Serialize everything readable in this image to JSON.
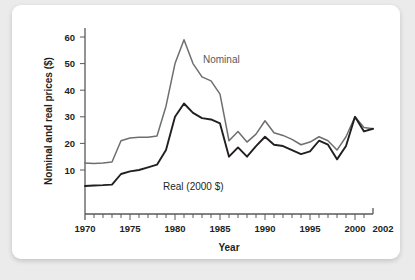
{
  "card": {
    "background_color": "#ffffff",
    "page_background_color": "#ebebeb"
  },
  "chart_data": {
    "type": "line",
    "title": "",
    "subtitle": "",
    "xlabel": "Year",
    "ylabel": "Nominal and real prices ($)",
    "xlim": [
      1970,
      2002
    ],
    "ylim": [
      0,
      65
    ],
    "xticks": [
      1970,
      1975,
      1980,
      1985,
      1990,
      1995,
      2000,
      2002
    ],
    "xticklabels": [
      "1970",
      "1975",
      "1980",
      "1985",
      "1990",
      "1995",
      "2000",
      "2002"
    ],
    "yticks": [
      10,
      20,
      30,
      40,
      50,
      60
    ],
    "yticklabels": [
      "10",
      "20",
      "30",
      "40",
      "50",
      "60"
    ],
    "minor_xticks_interval": 1,
    "grid": false,
    "legend_position": "inline-annotations",
    "x": [
      1970,
      1971,
      1972,
      1973,
      1974,
      1975,
      1976,
      1977,
      1978,
      1979,
      1980,
      1981,
      1982,
      1983,
      1984,
      1985,
      1986,
      1987,
      1988,
      1989,
      1990,
      1991,
      1992,
      1993,
      1994,
      1995,
      1996,
      1997,
      1998,
      1999,
      2000,
      2001,
      2002
    ],
    "series": [
      {
        "name": "Nominal",
        "label": "Nominal",
        "color": "#6d6e71",
        "values": [
          12.6,
          12.4,
          12.6,
          13.0,
          21.0,
          22.0,
          22.3,
          22.3,
          22.8,
          34.0,
          50.0,
          59.0,
          50.0,
          45.0,
          43.5,
          38.5,
          21.0,
          24.5,
          20.5,
          23.5,
          28.5,
          24.0,
          23.0,
          21.5,
          19.5,
          20.5,
          22.5,
          21.0,
          17.5,
          22.5,
          30.0,
          26.0,
          25.5
        ]
      },
      {
        "name": "Real (2000 $)",
        "label": "Real (2000 $)",
        "color": "#231f20",
        "values": [
          4.0,
          4.2,
          4.3,
          4.5,
          8.5,
          9.5,
          10.0,
          11.0,
          12.0,
          17.5,
          30.0,
          35.0,
          31.5,
          29.5,
          29.0,
          27.5,
          15.0,
          18.5,
          15.0,
          19.0,
          22.5,
          19.5,
          19.0,
          17.5,
          16.0,
          17.0,
          21.0,
          19.5,
          14.0,
          19.0,
          30.0,
          24.5,
          25.5
        ]
      }
    ],
    "annotations": [
      {
        "text": "Nominal",
        "x": 1983,
        "y": 52,
        "color": "#6d6e71"
      },
      {
        "text": "Real (2000 $)",
        "x": 1979.5,
        "y": 8.5,
        "color": "#231f20"
      }
    ]
  }
}
